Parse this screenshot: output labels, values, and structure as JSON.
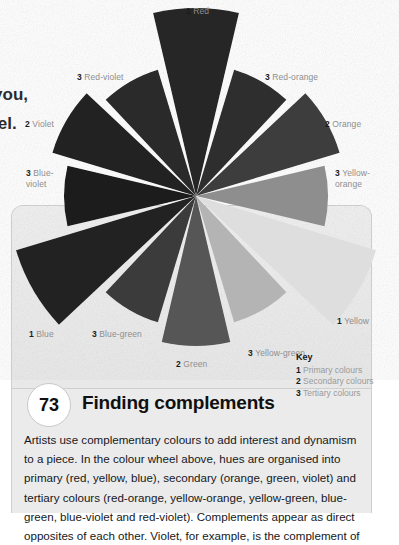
{
  "page": {
    "clipped_heading": "s",
    "clipped_body_line1": "n you,",
    "clipped_body_line2": "heel."
  },
  "color_wheel": {
    "segments": [
      {
        "label": "Red",
        "rank": "1",
        "angle_deg": 0,
        "gray": "#282828"
      },
      {
        "label": "Red-orange",
        "rank": "3",
        "angle_deg": 30,
        "gray": "#2f2f2f"
      },
      {
        "label": "Orange",
        "rank": "2",
        "angle_deg": 60,
        "gray": "#3c3c3c"
      },
      {
        "label": "Yellow-orange",
        "rank": "3",
        "angle_deg": 90,
        "gray": "#8e8e8e"
      },
      {
        "label": "Yellow",
        "rank": "1",
        "angle_deg": 120,
        "gray": "#dedede"
      },
      {
        "label": "Yellow-green",
        "rank": "3",
        "angle_deg": 150,
        "gray": "#b4b4b4"
      },
      {
        "label": "Green",
        "rank": "2",
        "angle_deg": 180,
        "gray": "#565656"
      },
      {
        "label": "Blue-green",
        "rank": "3",
        "angle_deg": 210,
        "gray": "#3a3a3a"
      },
      {
        "label": "Blue",
        "rank": "1",
        "angle_deg": 240,
        "gray": "#242424"
      },
      {
        "label": "Blue-violet",
        "rank": "3",
        "angle_deg": 270,
        "gray": "#1e1e1e"
      },
      {
        "label": "Violet",
        "rank": "2",
        "angle_deg": 300,
        "gray": "#222222"
      },
      {
        "label": "Red-violet",
        "rank": "3",
        "angle_deg": 330,
        "gray": "#2a2a2a"
      }
    ],
    "labels": {
      "red": "Red",
      "red_orange": "Red-orange",
      "orange": "Orange",
      "yellow_orange": "Yellow-\norange",
      "yellow": "Yellow",
      "yellow_green": "Yellow-green",
      "green": "Green",
      "blue_green": "Blue-green",
      "blue": "Blue",
      "blue_violet": "Blue-\nviolet",
      "violet": "Violet",
      "red_violet": "Red-violet"
    },
    "ranks": {
      "red": "1",
      "red_orange": "3",
      "orange": "2",
      "yellow_orange": "3",
      "yellow": "1",
      "yellow_green": "3",
      "green": "2",
      "blue_green": "3",
      "blue": "1",
      "blue_violet": "3",
      "violet": "2",
      "red_violet": "3"
    }
  },
  "key": {
    "title": "Key",
    "items": [
      {
        "rank": "1",
        "label": "Primary colours"
      },
      {
        "rank": "2",
        "label": "Secondary colours"
      },
      {
        "rank": "3",
        "label": "Tertiary colours"
      }
    ]
  },
  "section": {
    "number": "73",
    "title": "Finding complements",
    "body": "Artists use complementary colours to add interest and dynamism to a piece. In the colour wheel above, hues are organised into primary (red, yellow, blue), secondary (orange, green, violet) and tertiary colours (red-orange, yellow-orange, yellow-green, blue-green, blue-violet and red-violet). Complements appear as direct opposites of each other. Violet, for example, is the complement of"
  }
}
